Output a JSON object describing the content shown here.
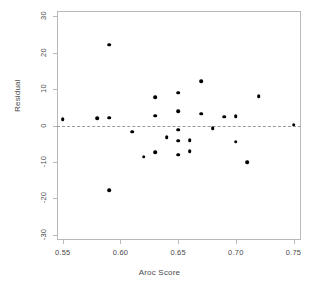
{
  "chart_data": {
    "type": "scatter",
    "title": "",
    "xlabel": "Aroc Score",
    "ylabel": "Residual",
    "xlim": [
      0.545,
      0.7565
    ],
    "ylim": [
      -31.5,
      31.5
    ],
    "xticks": [
      0.55,
      0.6,
      0.65,
      0.7,
      0.75
    ],
    "xticklabels": [
      "0.55",
      "0.60",
      "0.65",
      "0.70",
      "0.75"
    ],
    "yticks": [
      30,
      20,
      10,
      0,
      -10,
      -20,
      -30
    ],
    "yticklabels": [
      "30",
      "20",
      "10",
      "0",
      "-10",
      "-20",
      "-30"
    ],
    "grid": false,
    "legend": null,
    "annotations": [
      {
        "type": "hline",
        "y": 0,
        "style": "dashed",
        "color": "#9a9a9a"
      }
    ],
    "marker": {
      "shape": "circle",
      "color": "#000000",
      "size": 3.6
    },
    "points": [
      {
        "x": 0.55,
        "y": 1.7
      },
      {
        "x": 0.58,
        "y": 2.0
      },
      {
        "x": 0.59,
        "y": 22.2
      },
      {
        "x": 0.59,
        "y": 2.2
      },
      {
        "x": 0.59,
        "y": -17.8
      },
      {
        "x": 0.61,
        "y": -1.7
      },
      {
        "x": 0.62,
        "y": -8.6
      },
      {
        "x": 0.63,
        "y": 7.8
      },
      {
        "x": 0.63,
        "y": 2.7
      },
      {
        "x": 0.63,
        "y": -7.3
      },
      {
        "x": 0.64,
        "y": -3.3
      },
      {
        "x": 0.65,
        "y": 9.0
      },
      {
        "x": 0.65,
        "y": 4.0
      },
      {
        "x": 0.65,
        "y": -1.2
      },
      {
        "x": 0.65,
        "y": -4.2
      },
      {
        "x": 0.65,
        "y": -8.0
      },
      {
        "x": 0.66,
        "y": -4.0
      },
      {
        "x": 0.66,
        "y": -7.0
      },
      {
        "x": 0.67,
        "y": 12.2
      },
      {
        "x": 0.67,
        "y": 3.3
      },
      {
        "x": 0.68,
        "y": -0.7
      },
      {
        "x": 0.69,
        "y": 2.4
      },
      {
        "x": 0.7,
        "y": 2.5
      },
      {
        "x": 0.7,
        "y": -4.5
      },
      {
        "x": 0.71,
        "y": -10.1
      },
      {
        "x": 0.72,
        "y": 8.0
      },
      {
        "x": 0.75,
        "y": 0.2
      }
    ]
  },
  "colors": {
    "marker": "#000000",
    "frame": "#b9b9b9",
    "zero_line": "#9a9a9a",
    "text": "#4a4a4a",
    "background": "#ffffff"
  }
}
